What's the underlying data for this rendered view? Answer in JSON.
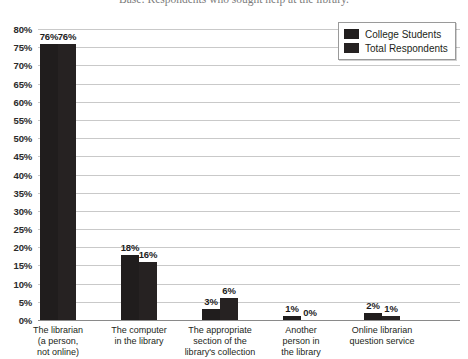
{
  "chart_data": {
    "type": "bar",
    "title": "Base: Respondents who sought help at the library.",
    "xlabel": "",
    "ylabel": "",
    "ylim": [
      0,
      80
    ],
    "ytick_step": 5,
    "grid": true,
    "legend_position": "top-right",
    "ytick_labels": [
      "80%",
      "75%",
      "70%",
      "65%",
      "60%",
      "55%",
      "50%",
      "45%",
      "40%",
      "35%",
      "30%",
      "25%",
      "20%",
      "15%",
      "10%",
      "5%",
      "0%"
    ],
    "categories": [
      "The librarian (a person, not online)",
      "The computer in the library",
      "The appropriate section of the library's collection",
      "Another person in the library",
      "Online librarian question service"
    ],
    "category_lines": [
      [
        "The librarian",
        "(a person,",
        "not online)"
      ],
      [
        "The computer",
        "in the library"
      ],
      [
        "The appropriate",
        "section of the",
        "library's collection"
      ],
      [
        "Another",
        "person in",
        "the library"
      ],
      [
        "Online librarian",
        "question service"
      ]
    ],
    "series": [
      {
        "name": "College Students",
        "values": [
          76,
          18,
          3,
          1,
          2
        ],
        "labels": [
          "76%",
          "18%",
          "3%",
          "1%",
          "2%"
        ],
        "color": "#201d1d"
      },
      {
        "name": "Total Respondents",
        "values": [
          76,
          16,
          6,
          0,
          1
        ],
        "labels": [
          "76%",
          "16%",
          "6%",
          "0%",
          "1%"
        ],
        "color": "#262222"
      }
    ]
  },
  "legend": {
    "items": [
      {
        "label": "College Students"
      },
      {
        "label": "Total Respondents"
      }
    ]
  }
}
